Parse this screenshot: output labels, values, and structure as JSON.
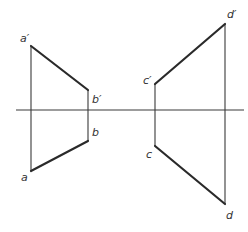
{
  "diagram": {
    "type": "orthographic-projection",
    "axis": {
      "x1": 16,
      "x2": 244,
      "y": 110
    },
    "colors": {
      "line": "#3a3a3a",
      "thick": "#2a2a2a",
      "label": "#333333",
      "background": "#ffffff"
    },
    "points": {
      "a_prime": {
        "label": "a′",
        "x": 31,
        "y": 46,
        "lx": 20,
        "ly": 42
      },
      "b_prime": {
        "label": "b′",
        "x": 88,
        "y": 90,
        "lx": 92,
        "ly": 103
      },
      "b": {
        "label": "b",
        "x": 88,
        "y": 141,
        "lx": 92,
        "ly": 136
      },
      "a": {
        "label": "a",
        "x": 31,
        "y": 171,
        "lx": 21,
        "ly": 181
      },
      "c_prime": {
        "label": "c′",
        "x": 155,
        "y": 84,
        "lx": 143,
        "ly": 84
      },
      "d_prime": {
        "label": "d′",
        "x": 225,
        "y": 24,
        "lx": 227,
        "ly": 18
      },
      "c": {
        "label": "c",
        "x": 155,
        "y": 146,
        "lx": 146,
        "ly": 158
      },
      "d": {
        "label": "d",
        "x": 225,
        "y": 204,
        "lx": 226,
        "ly": 219
      }
    },
    "segments": [
      {
        "name": "a-prime-b-prime",
        "from": "a′",
        "to": "b′",
        "weight": "thick"
      },
      {
        "name": "a-b",
        "from": "a",
        "to": "b",
        "weight": "thick"
      },
      {
        "name": "c-prime-d-prime",
        "from": "c′",
        "to": "d′",
        "weight": "thick"
      },
      {
        "name": "c-d",
        "from": "c",
        "to": "d",
        "weight": "thick"
      },
      {
        "name": "projector-a",
        "from": "a′",
        "to": "a",
        "weight": "thin"
      },
      {
        "name": "projector-b",
        "from": "b′",
        "to": "b",
        "weight": "thin"
      },
      {
        "name": "projector-c",
        "from": "c′",
        "to": "c",
        "weight": "thin"
      },
      {
        "name": "projector-d",
        "from": "d′",
        "to": "d",
        "weight": "thin"
      }
    ]
  }
}
